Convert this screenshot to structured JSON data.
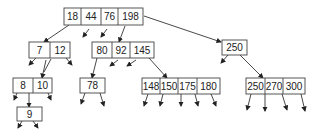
{
  "diagram": {
    "type": "b-tree",
    "nodes": [
      {
        "id": "root",
        "keys": [
          "18",
          "44",
          "76",
          "198"
        ],
        "x": 64,
        "y": 8,
        "cell_widths": [
          17,
          20,
          17,
          25
        ],
        "h": 17
      },
      {
        "id": "n-7-12",
        "keys": [
          "7",
          "12"
        ],
        "x": 29,
        "y": 42,
        "cell_widths": [
          21,
          20
        ],
        "h": 16
      },
      {
        "id": "n-80-92-145",
        "keys": [
          "80",
          "92",
          "145"
        ],
        "x": 92,
        "y": 42,
        "cell_widths": [
          20,
          18,
          24
        ],
        "h": 16
      },
      {
        "id": "n-250",
        "keys": [
          "250"
        ],
        "x": 222,
        "y": 40,
        "cell_widths": [
          25
        ],
        "h": 15
      },
      {
        "id": "n-8-10",
        "keys": [
          "8",
          "10"
        ],
        "x": 13,
        "y": 78,
        "cell_widths": [
          20,
          19
        ],
        "h": 15
      },
      {
        "id": "n-9",
        "keys": [
          "9"
        ],
        "x": 17,
        "y": 107,
        "cell_widths": [
          25
        ],
        "h": 14
      },
      {
        "id": "n-78",
        "keys": [
          "78"
        ],
        "x": 80,
        "y": 78,
        "cell_widths": [
          25
        ],
        "h": 15
      },
      {
        "id": "n-148-180",
        "keys": [
          "148",
          "150",
          "175",
          "180"
        ],
        "x": 142,
        "y": 78,
        "cell_widths": [
          18,
          18,
          19,
          23
        ],
        "h": 16
      },
      {
        "id": "n-250-300",
        "keys": [
          "250",
          "270",
          "300"
        ],
        "x": 246,
        "y": 78,
        "cell_widths": [
          19,
          18,
          22
        ],
        "h": 16
      }
    ],
    "edges": [
      {
        "from": [
          69,
          25
        ],
        "to": [
          44,
          42
        ],
        "arrow": true
      },
      {
        "from": [
          89,
          29
        ],
        "to": [
          83,
          37
        ],
        "arrow": true
      },
      {
        "from": [
          107,
          29
        ],
        "to": [
          101,
          37
        ],
        "arrow": true
      },
      {
        "from": [
          125,
          26
        ],
        "to": [
          119,
          42
        ],
        "arrow": true
      },
      {
        "from": [
          144,
          16
        ],
        "to": [
          221,
          42
        ],
        "arrow": true
      },
      {
        "from": [
          36,
          58
        ],
        "to": [
          29,
          65
        ],
        "arrow": true
      },
      {
        "from": [
          51,
          59
        ],
        "to": [
          44,
          72
        ],
        "arrow": false
      },
      {
        "from": [
          66,
          58
        ],
        "to": [
          72,
          65
        ],
        "arrow": true
      },
      {
        "from": [
          46,
          60
        ],
        "to": [
          42,
          78
        ],
        "arrow": true
      },
      {
        "from": [
          97,
          58
        ],
        "to": [
          92,
          78
        ],
        "arrow": true
      },
      {
        "from": [
          118,
          60
        ],
        "to": [
          110,
          66
        ],
        "arrow": true
      },
      {
        "from": [
          136,
          60
        ],
        "to": [
          127,
          66
        ],
        "arrow": true
      },
      {
        "from": [
          149,
          58
        ],
        "to": [
          167,
          78
        ],
        "arrow": true
      },
      {
        "from": [
          228,
          55
        ],
        "to": [
          221,
          63
        ],
        "arrow": true
      },
      {
        "from": [
          240,
          55
        ],
        "to": [
          263,
          78
        ],
        "arrow": true
      },
      {
        "from": [
          17,
          93
        ],
        "to": [
          14,
          100
        ],
        "arrow": true
      },
      {
        "from": [
          29,
          93
        ],
        "to": [
          29,
          107
        ],
        "arrow": true
      },
      {
        "from": [
          48,
          93
        ],
        "to": [
          51,
          100
        ],
        "arrow": true
      },
      {
        "from": [
          22,
          121
        ],
        "to": [
          18,
          128
        ],
        "arrow": true
      },
      {
        "from": [
          33,
          121
        ],
        "to": [
          38,
          128
        ],
        "arrow": true
      },
      {
        "from": [
          85,
          93
        ],
        "to": [
          81,
          104
        ],
        "arrow": true
      },
      {
        "from": [
          100,
          93
        ],
        "to": [
          104,
          106
        ],
        "arrow": true
      },
      {
        "from": [
          148,
          94
        ],
        "to": [
          144,
          106
        ],
        "arrow": true
      },
      {
        "from": [
          163,
          94
        ],
        "to": [
          160,
          106
        ],
        "arrow": true
      },
      {
        "from": [
          181,
          94
        ],
        "to": [
          181,
          106
        ],
        "arrow": true
      },
      {
        "from": [
          195,
          94
        ],
        "to": [
          198,
          106
        ],
        "arrow": true
      },
      {
        "from": [
          211,
          94
        ],
        "to": [
          216,
          106
        ],
        "arrow": true
      },
      {
        "from": [
          251,
          94
        ],
        "to": [
          247,
          110
        ],
        "arrow": true
      },
      {
        "from": [
          265,
          94
        ],
        "to": [
          265,
          111
        ],
        "arrow": true
      },
      {
        "from": [
          282,
          94
        ],
        "to": [
          287,
          110
        ],
        "arrow": true
      },
      {
        "from": [
          301,
          94
        ],
        "to": [
          305,
          111
        ],
        "arrow": true
      }
    ],
    "colors": {
      "stroke": "#444444",
      "text": "#222222",
      "background": "#ffffff"
    }
  }
}
